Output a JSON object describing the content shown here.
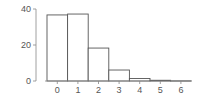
{
  "chart_data": {
    "type": "bar",
    "title": "",
    "xlabel": "",
    "ylabel": "",
    "categories": [
      "0",
      "1",
      "2",
      "3",
      "4",
      "5",
      "6"
    ],
    "values": [
      36.7,
      37.2,
      18.3,
      6.1,
      1.4,
      0.4,
      0.1
    ],
    "ylim": [
      0,
      40
    ],
    "yticks": [
      0,
      20,
      40
    ],
    "xticks": [
      "0",
      "1",
      "2",
      "3",
      "4",
      "5",
      "6"
    ],
    "grid": false,
    "legend": null,
    "colors": {
      "bar_fill": "#ffffff",
      "bar_stroke": "#555555",
      "axis": "#888888",
      "text": "#555555"
    }
  }
}
